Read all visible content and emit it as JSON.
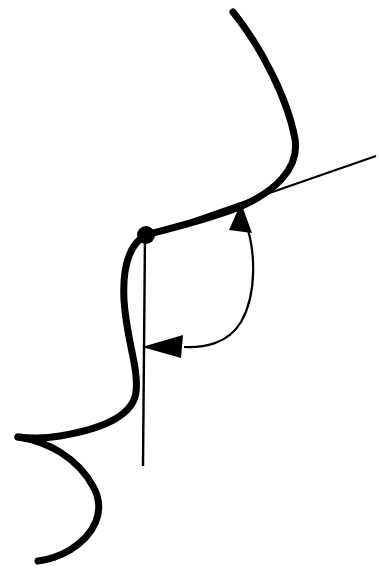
{
  "figure": {
    "background_color": "#ffffff",
    "ink_color": "#000000",
    "canvas": {
      "width": 379,
      "height": 572
    },
    "elements": {
      "curve": {
        "name": "main-curve",
        "description": "Thick sinuous S-shaped curve running from upper right, down through the marked point, bending left into a cusp and sweeping to the lower left tail",
        "stroke_width": 7,
        "path": "M 233 12 C 262 48, 288 100, 295 139 C 300 170, 272 192, 244 205 C 214 218, 172 228, 149 234 C 132 240, 122 262, 124 300 C 126 338, 139 368, 136 392 C 133 418, 96 430, 60 436 C 42 439, 28 438, 18 437"
      },
      "curve_lower_branch": {
        "name": "curve-lower-branch",
        "description": "Lower branch emerging from the cusp at the left, arcing right and down to the bottom-left tail",
        "stroke_width": 7,
        "path": "M 18 437 C 46 441, 78 457, 94 488 C 106 512, 94 535, 70 550 C 58 557, 46 560, 38 561"
      },
      "tangent_line": {
        "name": "tangent-line",
        "description": "Thin straight tangent line through the curve heading to the upper right edge",
        "stroke_width": 2.2,
        "x1": 146,
        "y1": 236,
        "x2": 376,
        "y2": 156
      },
      "vertical_line": {
        "name": "vertical-reference-line",
        "description": "Thin vertical reference line dropped from the marked point",
        "stroke_width": 2.4,
        "x1": 145,
        "y1": 234,
        "x2": 143,
        "y2": 466
      },
      "point_marker": {
        "name": "point-marker-dot",
        "description": "Filled black dot marking the point of tangency on the curve",
        "cx": 146,
        "cy": 235,
        "r": 9
      },
      "angle_arc": {
        "name": "angle-arc",
        "description": "Thin double-headed arc spanning from the tangent line down to the vertical line, indicating the angle",
        "stroke_width": 2.2,
        "path": "M 245 221 C 256 250, 257 294, 241 322 C 228 344, 203 348, 184 347"
      },
      "arrowhead_upper": {
        "name": "arrowhead-upper",
        "description": "Solid triangular arrowhead at the top of the arc pointing up toward the tangent line",
        "points": "241,203 252,233 229,230"
      },
      "arrowhead_lower": {
        "name": "arrowhead-lower",
        "description": "Solid triangular arrowhead at the bottom of the arc pointing left toward the vertical line",
        "points": "142,347 183,335 181,358"
      }
    }
  }
}
